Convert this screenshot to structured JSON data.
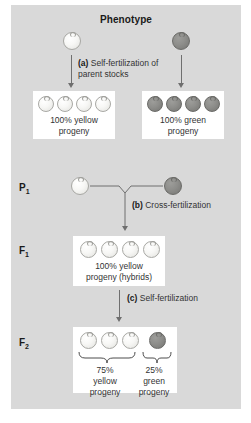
{
  "figure": {
    "title": "Phenotype",
    "background_color": "#d9d9d9",
    "pea_yellow_color": "#f7f7f5",
    "pea_green_color": "#8e8e8b",
    "connector_color": "#6f6f6f"
  },
  "steps": {
    "a": {
      "marker": "(a)",
      "text": "Self-fertilization of parent stocks"
    },
    "b": {
      "marker": "(b)",
      "text": "Cross-fertilization"
    },
    "c": {
      "marker": "(c)",
      "text": "Self-fertilization"
    }
  },
  "generations": {
    "p1": "P",
    "p1_sub": "1",
    "f1": "F",
    "f1_sub": "1",
    "f2": "F",
    "f2_sub": "2"
  },
  "parents": {
    "yellow": {
      "phenotype": "yellow"
    },
    "green": {
      "phenotype": "green"
    }
  },
  "selfed_yellow_box": {
    "peas": [
      "yellow",
      "yellow",
      "yellow",
      "yellow"
    ],
    "line1": "100% yellow",
    "line2": "progeny"
  },
  "selfed_green_box": {
    "peas": [
      "green",
      "green",
      "green",
      "green"
    ],
    "line1": "100% green",
    "line2": "progeny"
  },
  "f1_box": {
    "peas": [
      "yellow",
      "yellow",
      "yellow",
      "yellow"
    ],
    "line1": "100% yellow",
    "line2": "progeny (hybrids)"
  },
  "f2_box": {
    "peas": [
      "yellow",
      "yellow",
      "yellow",
      "green"
    ],
    "groups": [
      {
        "percent": "75%",
        "line2": "yellow",
        "line3": "progeny"
      },
      {
        "percent": "25%",
        "line2": "green",
        "line3": "progeny"
      }
    ]
  }
}
